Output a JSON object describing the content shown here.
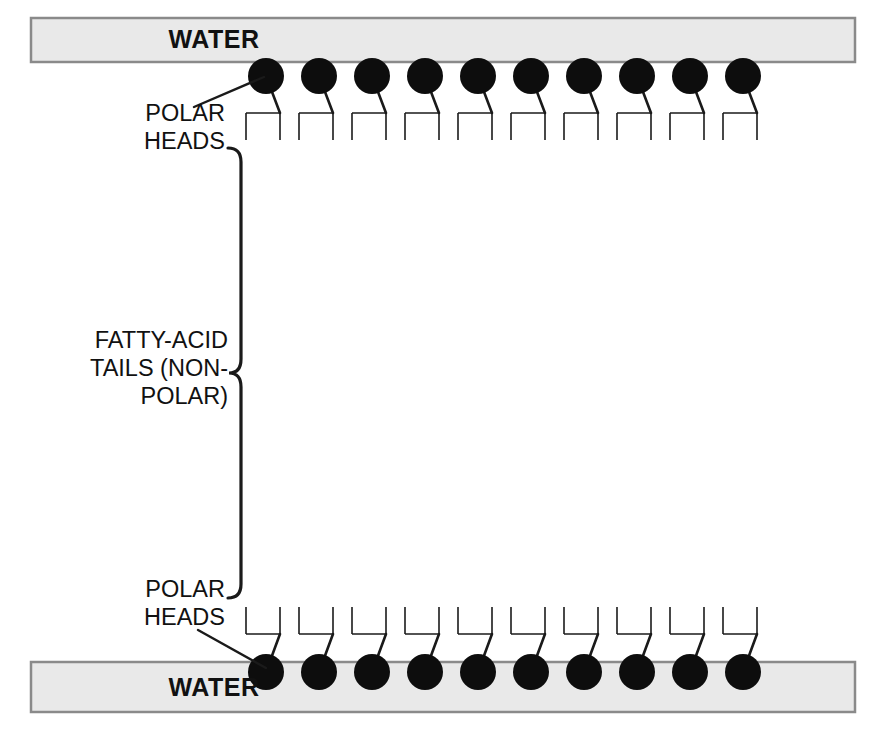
{
  "figure": {
    "width": 883,
    "height": 739,
    "background": "#ffffff"
  },
  "colors": {
    "water_fill": "#e9e9e9",
    "water_border": "#8a8a8a",
    "head_fill": "#0d0d0d",
    "line": "#1a1a1a",
    "text": "#111111",
    "page_background": "#ffffff"
  },
  "water_bands": [
    {
      "id": "water-top",
      "label": "WATER",
      "x": 31,
      "y": 18,
      "width": 824,
      "height": 44,
      "label_x": 214,
      "label_y": 48
    },
    {
      "id": "water-bottom",
      "label": "WATER",
      "x": 31,
      "y": 662,
      "width": 824,
      "height": 50,
      "label_x": 214,
      "label_y": 696
    }
  ],
  "annotations": [
    {
      "id": "polar-heads-top",
      "lines": [
        "POLAR",
        "HEADS"
      ],
      "anchor_x": 225,
      "line_y": [
        121,
        149
      ],
      "leader": {
        "x1": 194,
        "y1": 107,
        "x2": 264,
        "y2": 77
      }
    },
    {
      "id": "fatty-acid-tails",
      "lines": [
        "FATTY-ACID",
        "TAILS (NON-",
        "POLAR)"
      ],
      "anchor_x": 228,
      "line_y": [
        348,
        376,
        404
      ],
      "leader": null
    },
    {
      "id": "polar-heads-bottom",
      "lines": [
        "POLAR",
        "HEADS"
      ],
      "anchor_x": 225,
      "line_y": [
        597,
        625
      ],
      "leader": {
        "x1": 198,
        "y1": 630,
        "x2": 266,
        "y2": 668
      }
    }
  ],
  "brace": {
    "id": "tails-brace",
    "top_y": 148,
    "bottom_y": 598,
    "mid_y": 373,
    "spine_x": 241,
    "tip_x": 228,
    "curve_radius": 14,
    "stroke_width": 3.2
  },
  "bilayer": {
    "lipid_count_per_leaflet": 10,
    "head_radius": 18,
    "first_head_cx": 266,
    "head_spacing": 53,
    "upper": {
      "head_cy": 76,
      "neck_end_y": 113,
      "bar_y": 113,
      "bar_left_dx": -20,
      "bar_right_dx": 14,
      "stem_bottom_y": 140,
      "zigzag_start_y": 140,
      "zigzag_end_y": 352,
      "zigzag_segments": 8,
      "zigzag_amplitude": 13
    },
    "lower": {
      "head_cy": 672,
      "neck_end_y": 634,
      "bar_y": 634,
      "bar_left_dx": -20,
      "bar_right_dx": 14,
      "stem_top_y": 607,
      "zigzag_start_y": 607,
      "zigzag_end_y": 388,
      "zigzag_segments": 8,
      "zigzag_amplitude": 13
    },
    "tail_left_dx": -20,
    "tail_right_dx": 14,
    "stroke_width": 1.6
  },
  "diagram_data": {
    "type": "diagram",
    "subject": "lipid bilayer",
    "regions": [
      "WATER",
      "POLAR HEADS",
      "FATTY-ACID TAILS (NON-POLAR)",
      "POLAR HEADS",
      "WATER"
    ],
    "leaflets": 2,
    "molecules_per_leaflet": 10,
    "tails_per_molecule": 2
  }
}
